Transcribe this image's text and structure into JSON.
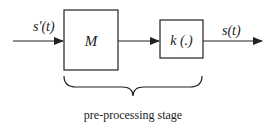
{
  "diagram": {
    "type": "block-diagram",
    "input_signal": "s'(t)",
    "output_signal": "s(t)",
    "blocks": [
      {
        "id": "M",
        "label": "M"
      },
      {
        "id": "k",
        "label": "k (.)"
      }
    ],
    "edges": [
      {
        "from": "input",
        "to": "M",
        "label": "s'(t)"
      },
      {
        "from": "M",
        "to": "k",
        "label": ""
      },
      {
        "from": "k",
        "to": "output",
        "label": "s(t)"
      }
    ],
    "group": {
      "label": "pre-processing stage",
      "members": [
        "M",
        "k"
      ]
    }
  },
  "colors": {
    "stroke": "#222222",
    "background": "#ffffff"
  }
}
